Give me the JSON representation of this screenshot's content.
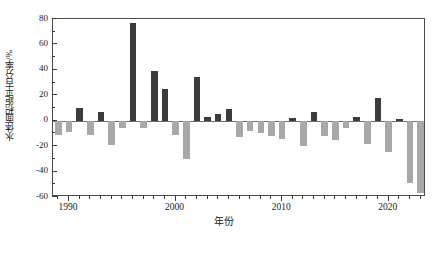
{
  "chart_data": {
    "type": "bar",
    "title": "",
    "xlabel": "年份",
    "ylabel": "水体面积距平百分率/%",
    "xlim": [
      1988.5,
      2023.5
    ],
    "ylim": [
      -60,
      80
    ],
    "ytick_labels": [
      "80",
      "60",
      "40",
      "20",
      "0",
      "-20",
      "-40",
      "-60"
    ],
    "ytick_values": [
      80,
      60,
      40,
      20,
      0,
      -20,
      -40,
      -60
    ],
    "ytick_minor_step": 10,
    "xtick_labels": [
      "1990",
      "2000",
      "2010",
      "2020"
    ],
    "xtick_values": [
      1990,
      2000,
      2010,
      2020
    ],
    "xtick_minor_step": 1,
    "grid": false,
    "legend": "none",
    "colors": {
      "positive_bar": "#3c3c3c",
      "negative_bar": "#a8a8a8",
      "axis": "#4a4a4a",
      "text": "#1a1a1a"
    },
    "categories": [
      1989,
      1990,
      1991,
      1992,
      1993,
      1994,
      1995,
      1996,
      1997,
      1998,
      1999,
      2000,
      2001,
      2002,
      2003,
      2004,
      2005,
      2006,
      2007,
      2008,
      2009,
      2010,
      2011,
      2012,
      2013,
      2014,
      2015,
      2016,
      2017,
      2018,
      2019,
      2020,
      2021,
      2022,
      2023
    ],
    "values": [
      -11,
      -9,
      10,
      -11,
      7,
      -19,
      -6,
      77,
      -6,
      39,
      25,
      -11,
      -30,
      34,
      3,
      5,
      9,
      -13,
      -8,
      -10,
      -12,
      -14,
      2,
      -20,
      7,
      -12,
      -15,
      -6,
      3,
      -18,
      18,
      -25,
      1,
      -49,
      -57
    ]
  }
}
